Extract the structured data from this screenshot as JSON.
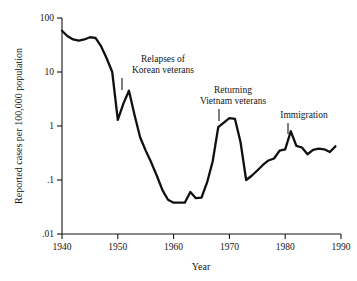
{
  "chart_data": {
    "type": "line",
    "title": "",
    "xlabel": "Year",
    "ylabel": "Reported cases per 100,000 population",
    "yscale": "log",
    "xlim": [
      1940,
      1990
    ],
    "ylim": [
      0.01,
      100
    ],
    "grid": false,
    "legend": "none",
    "y_ticks": [
      {
        "value": 100,
        "label": "100"
      },
      {
        "value": 10,
        "label": "10"
      },
      {
        "value": 1,
        "label": "1"
      },
      {
        "value": 0.1,
        "label": ".1"
      },
      {
        "value": 0.01,
        "label": ".01"
      }
    ],
    "x_ticks": [
      {
        "value": 1940,
        "label": "1940"
      },
      {
        "value": 1950,
        "label": "1950"
      },
      {
        "value": 1960,
        "label": "1960"
      },
      {
        "value": 1970,
        "label": "1970"
      },
      {
        "value": 1980,
        "label": "1980"
      },
      {
        "value": 1990,
        "label": "1990"
      }
    ],
    "series": [
      {
        "name": "Reported cases per 100,000 population",
        "color": "#101010",
        "x": [
          1940,
          1941,
          1942,
          1943,
          1944,
          1945,
          1946,
          1947,
          1948,
          1949,
          1950,
          1951,
          1952,
          1953,
          1954,
          1955,
          1956,
          1957,
          1958,
          1959,
          1960,
          1961,
          1962,
          1963,
          1964,
          1965,
          1966,
          1967,
          1968,
          1969,
          1970,
          1971,
          1972,
          1973,
          1974,
          1975,
          1976,
          1977,
          1978,
          1979,
          1980,
          1981,
          1982,
          1983,
          1984,
          1985,
          1986,
          1987,
          1988,
          1989
        ],
        "y": [
          58,
          46,
          40,
          38,
          40,
          44,
          43,
          30,
          18,
          10,
          1.3,
          2.6,
          4.5,
          1.6,
          0.62,
          0.35,
          0.21,
          0.12,
          0.065,
          0.043,
          0.038,
          0.038,
          0.038,
          0.06,
          0.046,
          0.047,
          0.09,
          0.22,
          0.95,
          1.15,
          1.4,
          1.35,
          0.5,
          0.1,
          0.12,
          0.15,
          0.19,
          0.23,
          0.25,
          0.35,
          0.37,
          0.8,
          0.43,
          0.4,
          0.3,
          0.36,
          0.38,
          0.37,
          0.33,
          0.42
        ]
      }
    ],
    "annotations": [
      {
        "id": "korean-veterans",
        "lines": [
          "Relapses of",
          "Korean veterans"
        ],
        "point_year": 1951,
        "point_value": 2.6,
        "text_x": 163,
        "text_y_first": 62,
        "text_y_second": 73,
        "tick_x": 122,
        "tick_y1": 78,
        "tick_y2": 90
      },
      {
        "id": "vietnam-veterans",
        "lines": [
          "Returning",
          "Vietnam veterans"
        ],
        "point_year": 1967,
        "point_value": 0.95,
        "text_x": 233,
        "text_y_first": 93,
        "text_y_second": 104,
        "tick_x": 219,
        "tick_y1": 109,
        "tick_y2": 121
      },
      {
        "id": "immigration",
        "lines": [
          "Immigration"
        ],
        "point_year": 1979,
        "point_value": 0.35,
        "text_x": 304,
        "text_y_first": 118,
        "text_y_second": null,
        "tick_x": 288,
        "tick_y1": 123,
        "tick_y2": 134
      }
    ]
  },
  "figure": {
    "x_axis_title": "Year",
    "y_axis_title": "Reported cases per 100,000 population"
  }
}
